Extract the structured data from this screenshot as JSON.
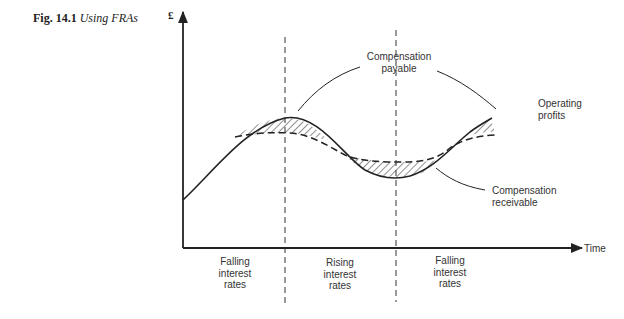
{
  "figure": {
    "number": "Fig. 14.1",
    "title": "Using FRAs"
  },
  "axes": {
    "y_label": "£",
    "x_label": "Time"
  },
  "annotations": {
    "compensation_payable": [
      "Compensation",
      "payable"
    ],
    "operating_profits": [
      "Operating",
      "profits"
    ],
    "compensation_receivable": [
      "Compensation",
      "receivable"
    ]
  },
  "periods": [
    {
      "lines": [
        "Falling",
        "interest",
        "rates"
      ]
    },
    {
      "lines": [
        "Rising",
        "interest",
        "rates"
      ]
    },
    {
      "lines": [
        "Falling",
        "interest",
        "rates"
      ]
    }
  ],
  "colors": {
    "ink": "#222222",
    "background": "#ffffff"
  }
}
